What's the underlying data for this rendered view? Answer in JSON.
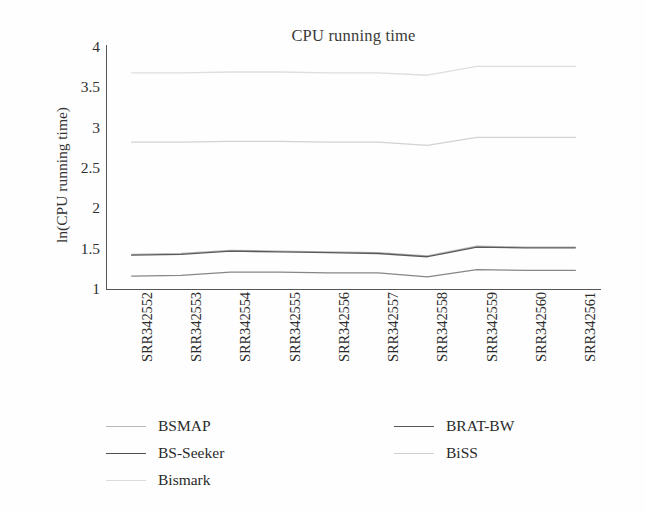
{
  "chart_data": {
    "type": "line",
    "title": "CPU running time",
    "xlabel": "",
    "ylabel": "ln(CPU running time)",
    "ylim": [
      1,
      4
    ],
    "yticks": [
      1,
      1.5,
      2,
      2.5,
      3,
      3.5,
      4
    ],
    "ytick_labels": [
      "1",
      "1.5",
      "2",
      "2.5",
      "3",
      "3.5",
      "4"
    ],
    "grid": false,
    "legend_position": "bottom",
    "categories": [
      "SRR342552",
      "SRR342553",
      "SRR342554",
      "SRR342555",
      "SRR342556",
      "SRR342557",
      "SRR342558",
      "SRR342559",
      "SRR342560",
      "SRR342561"
    ],
    "series": [
      {
        "name": "BSMAP",
        "color": "#b9b9b9",
        "values": [
          1.43,
          1.44,
          1.48,
          1.47,
          1.46,
          1.45,
          1.41,
          1.53,
          1.52,
          1.52
        ]
      },
      {
        "name": "BS-Seeker",
        "color": "#5a5a5a",
        "values": [
          1.42,
          1.43,
          1.47,
          1.46,
          1.45,
          1.44,
          1.4,
          1.52,
          1.51,
          1.51
        ]
      },
      {
        "name": "Bismark",
        "color": "#dedede",
        "values": [
          3.68,
          3.68,
          3.69,
          3.69,
          3.68,
          3.68,
          3.65,
          3.76,
          3.76,
          3.76
        ]
      },
      {
        "name": "BRAT-BW",
        "color": "#878787",
        "values": [
          1.16,
          1.17,
          1.21,
          1.21,
          1.2,
          1.2,
          1.15,
          1.24,
          1.23,
          1.23
        ]
      },
      {
        "name": "BiSS",
        "color": "#d2d2d2",
        "values": [
          2.82,
          2.82,
          2.83,
          2.83,
          2.82,
          2.82,
          2.78,
          2.88,
          2.88,
          2.88
        ]
      }
    ]
  },
  "legend": {
    "items": [
      {
        "label": "BSMAP",
        "color": "#b9b9b9",
        "width": "1.6px",
        "column": 0,
        "row": 0
      },
      {
        "label": "BS-Seeker",
        "color": "#4f4f4f",
        "width": "1.7px",
        "column": 0,
        "row": 1
      },
      {
        "label": "Bismark",
        "color": "#dcdcdc",
        "width": "1.6px",
        "column": 0,
        "row": 2
      },
      {
        "label": "BRAT-BW",
        "color": "#555555",
        "width": "1.7px",
        "column": 1,
        "row": 0
      },
      {
        "label": "BiSS",
        "color": "#cfcfcf",
        "width": "1.6px",
        "column": 1,
        "row": 1
      }
    ]
  },
  "colors": {
    "axis": "#555555",
    "text": "#2a2a2a",
    "background": "#fefefe"
  }
}
